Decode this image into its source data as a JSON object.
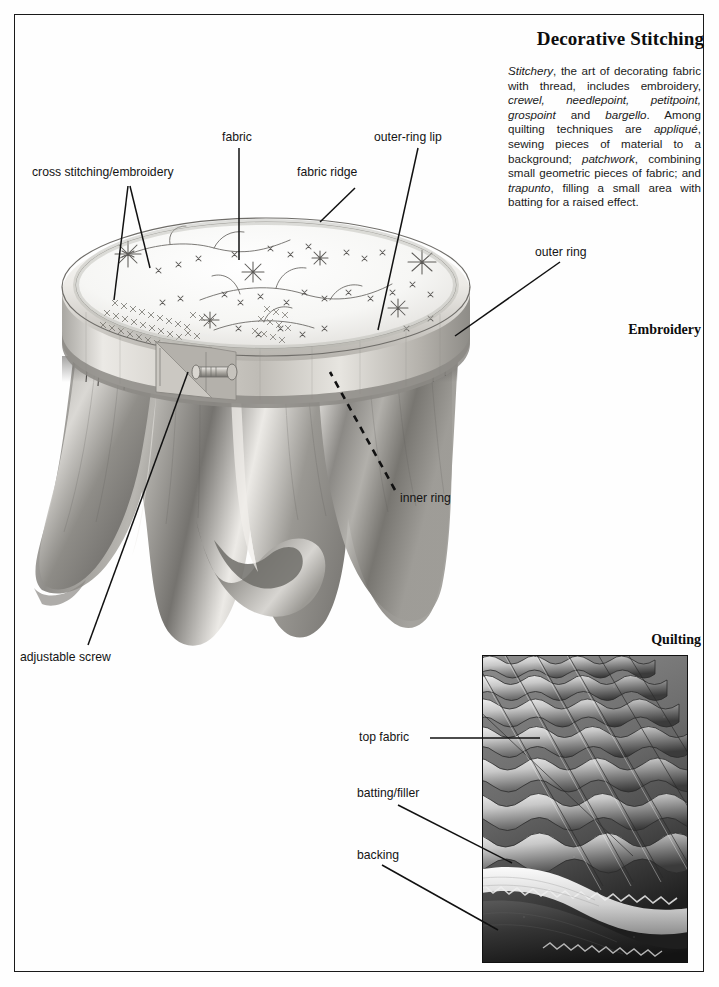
{
  "page": {
    "title": "Decorative Stitching",
    "intro_html": "<i>Stitchery</i>, the art of decorating fabric with thread, includes embroidery, <i>crewel, needlepoint, petitpoint, grospoint</i> and <i>bargello</i>. Among quilting techniques are <i>appliqu&eacute;</i>, sewing pieces of material to a background; <i>patchwork</i>, combining small geometric pieces of fabric; and <i>trapunto</i>, filling a small area with batting for a raised effect."
  },
  "sections": {
    "embroidery_heading": "Embroidery",
    "quilting_heading": "Quilting"
  },
  "labels": {
    "cross_stitching": "cross stitching/embroidery",
    "fabric": "fabric",
    "fabric_ridge": "fabric ridge",
    "outer_ring_lip": "outer-ring lip",
    "outer_ring": "outer ring",
    "inner_ring": "inner ring",
    "adjustable_screw": "adjustable screw",
    "top_fabric": "top fabric",
    "batting_filler": "batting/filler",
    "backing": "backing"
  },
  "colors": {
    "ink": "#141414",
    "frame": "#1a1a1a",
    "paper": "#fefefe"
  },
  "illustration": {
    "embroidery_hoop_alt": "pencil illustration of a round embroidery hoop with cross-stitch floral needlework stretched across it and fabric draping below",
    "quilting_photo_alt": "photograph of a quilted textile showing diagonal rows of puffed squares with exposed batting and backing layers at the edge"
  }
}
